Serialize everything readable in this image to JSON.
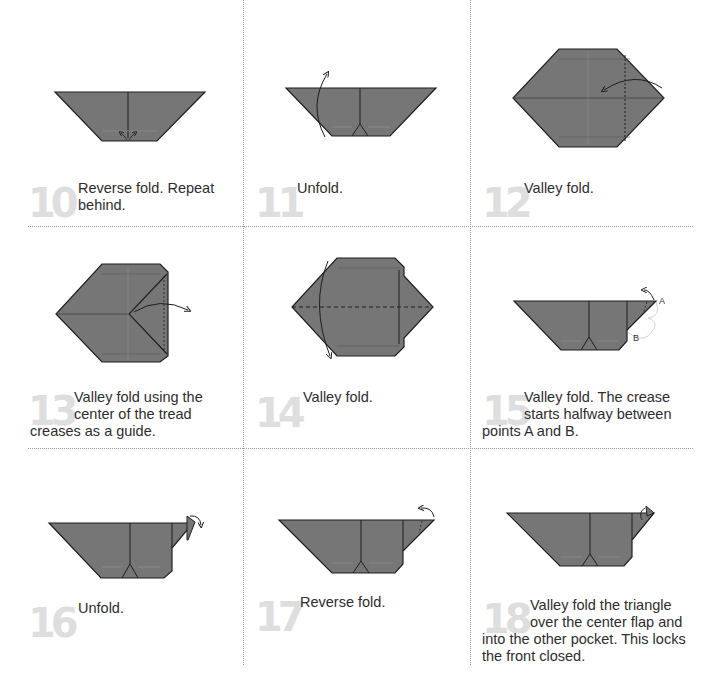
{
  "colors": {
    "paper": "#767676",
    "crease": "#1e1e1e",
    "step_number": "#dedede",
    "text": "#2d2d2d",
    "grid_line": "#9a9a9a"
  },
  "steps": [
    {
      "number": "10",
      "text_line1": "Reverse fold. Repeat",
      "text_line2": "behind.",
      "text_line3": ""
    },
    {
      "number": "11",
      "text_line1": "Unfold.",
      "text_line2": "",
      "text_line3": ""
    },
    {
      "number": "12",
      "text_line1": "Valley fold.",
      "text_line2": "",
      "text_line3": ""
    },
    {
      "number": "13",
      "text_line1": "Valley fold using the",
      "text_line2": "center of the tread",
      "text_line3": "creases as a guide."
    },
    {
      "number": "14",
      "text_line1": "Valley fold.",
      "text_line2": "",
      "text_line3": ""
    },
    {
      "number": "15",
      "text_line1": "Valley fold. The crease",
      "text_line2": "starts halfway between",
      "text_line3": "points A and B."
    },
    {
      "number": "16",
      "text_line1": "Unfold.",
      "text_line2": "",
      "text_line3": ""
    },
    {
      "number": "17",
      "text_line1": "Reverse fold.",
      "text_line2": "",
      "text_line3": ""
    },
    {
      "number": "18",
      "text_line1": "Valley fold the triangle",
      "text_line2": "over the center flap and",
      "text_line3": "into the other pocket. This locks",
      "text_line4": "the front closed."
    }
  ],
  "point_labels": {
    "a": "A",
    "b": "B"
  }
}
